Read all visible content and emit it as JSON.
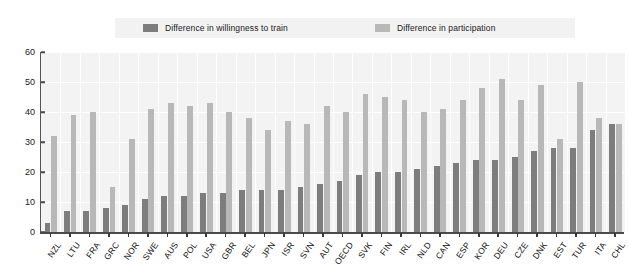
{
  "legend": {
    "items": [
      {
        "label": "Difference in willingness to train",
        "color": "#7d7d7d",
        "icon": "legend-swatch-dark"
      },
      {
        "label": "Difference in participation",
        "color": "#b8b8b8",
        "icon": "legend-swatch-light"
      }
    ]
  },
  "axis": {
    "yticks": [
      "0",
      "10",
      "20",
      "30",
      "40",
      "50",
      "60"
    ]
  },
  "chart_data": {
    "type": "bar",
    "title": "",
    "xlabel": "",
    "ylabel": "",
    "ylim": [
      0,
      60
    ],
    "ytick_step": 10,
    "grid": true,
    "legend_position": "top",
    "categories": [
      "NZL",
      "LTU",
      "FRA",
      "GRC",
      "NOR",
      "SWE",
      "AUS",
      "POL",
      "USA",
      "GBR",
      "BEL",
      "JPN",
      "ISR",
      "SVN",
      "AUT",
      "OECD",
      "SVK",
      "FIN",
      "IRL",
      "NLD",
      "CAN",
      "ESP",
      "KOR",
      "DEU",
      "CZE",
      "DNK",
      "EST",
      "TUR",
      "ITA",
      "CHL"
    ],
    "series": [
      {
        "name": "Difference in willingness to train",
        "color": "#7d7d7d",
        "values": [
          3,
          7,
          7,
          8,
          9,
          11,
          12,
          12,
          13,
          13,
          14,
          14,
          14,
          15,
          16,
          17,
          19,
          20,
          20,
          21,
          22,
          23,
          24,
          24,
          25,
          27,
          28,
          28,
          34,
          36
        ]
      },
      {
        "name": "Difference in participation",
        "color": "#b8b8b8",
        "values": [
          32,
          39,
          40,
          15,
          31,
          41,
          43,
          42,
          43,
          40,
          38,
          34,
          37,
          36,
          42,
          40,
          46,
          45,
          44,
          40,
          41,
          44,
          48,
          51,
          44,
          49,
          31,
          50,
          38,
          36
        ]
      }
    ]
  }
}
